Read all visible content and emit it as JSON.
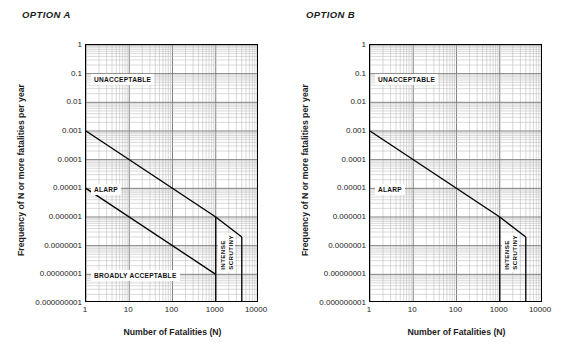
{
  "panels": [
    {
      "title": "OPTION A",
      "axes": {
        "ylabel": "Frequency of N or more fatalities per year",
        "xlabel": "Number of Fatalities (N)",
        "yticks": [
          "1",
          "0.1",
          "0.01",
          "0.001",
          "0.0001",
          "0.00001",
          "0.000001",
          "0.0000001",
          "0.00000001",
          "0.000000001"
        ],
        "xticks": [
          "1",
          "10",
          "100",
          "1000",
          "10000"
        ]
      },
      "zones": {
        "unacceptable": "UNACCEPTABLE",
        "alarp": "ALARP",
        "broadly_acceptable": "BROADLY ACCEPTABLE",
        "intense": "INTENSE",
        "scrutiny": "SCRUTINY"
      }
    },
    {
      "title": "OPTION B",
      "axes": {
        "ylabel": "Frequency of N or more fatalities per year",
        "xlabel": "Number of Fatalities (N)",
        "yticks": [
          "1",
          "0.1",
          "0.01",
          "0.001",
          "0.0001",
          "0.00001",
          "0.000001",
          "0.0000001",
          "0.00000001",
          "0.000000001"
        ],
        "xticks": [
          "1",
          "10",
          "100",
          "1000",
          "10000"
        ]
      },
      "zones": {
        "unacceptable": "UNACCEPTABLE",
        "alarp": "ALARP",
        "broadly_acceptable": "",
        "intense": "INTENSE",
        "scrutiny": "SCRUTINY"
      }
    }
  ],
  "colors": {
    "line": "#000000",
    "major_grid": "#7a7a7a",
    "minor_grid": "#b9b9b9",
    "axis": "#000000",
    "text": "#1b1b1b",
    "background": "#ffffff"
  },
  "chart_data": [
    {
      "type": "line",
      "title": "OPTION A",
      "xlabel": "Number of Fatalities (N)",
      "ylabel": "Frequency of N or more fatalities per year",
      "xscale": "log",
      "yscale": "log",
      "xlim": [
        1,
        10000
      ],
      "ylim": [
        1e-09,
        1
      ],
      "xticks": [
        1,
        10,
        100,
        1000,
        10000
      ],
      "yticks": [
        1,
        0.1,
        0.01,
        0.001,
        0.0001,
        1e-05,
        1e-06,
        1e-07,
        1e-08,
        1e-09
      ],
      "grid": "log-minor-both",
      "legend": "none",
      "series": [
        {
          "name": "Upper intolerability limit (UNACCEPTABLE / ALARP boundary)",
          "points": [
            [
              1,
              0.001
            ],
            [
              1000,
              1e-06
            ],
            [
              4000,
              2e-07
            ]
          ]
        },
        {
          "name": "Lower negligibility limit (ALARP / BROADLY ACCEPTABLE boundary)",
          "points": [
            [
              1,
              1e-05
            ],
            [
              1000,
              1e-08
            ]
          ]
        }
      ],
      "vertical_markers": [
        {
          "name": "intense-scrutiny-left",
          "x": 1000
        },
        {
          "name": "intense-scrutiny-right",
          "x": 4000
        }
      ],
      "annotations": [
        {
          "text": "UNACCEPTABLE",
          "x": 3,
          "y": 0.07
        },
        {
          "text": "ALARP",
          "x": 3,
          "y": 3e-05
        },
        {
          "text": "BROADLY ACCEPTABLE",
          "x": 3,
          "y": 1e-08
        },
        {
          "text": "INTENSE",
          "x": 1300,
          "y": 1e-07,
          "rotation": -90
        },
        {
          "text": "SCRUTINY",
          "x": 2400,
          "y": 1e-07,
          "rotation": -90
        }
      ]
    },
    {
      "type": "line",
      "title": "OPTION B",
      "xlabel": "Number of Fatalities (N)",
      "ylabel": "Frequency of N or more fatalities per year",
      "xscale": "log",
      "yscale": "log",
      "xlim": [
        1,
        10000
      ],
      "ylim": [
        1e-09,
        1
      ],
      "xticks": [
        1,
        10,
        100,
        1000,
        10000
      ],
      "yticks": [
        1,
        0.1,
        0.01,
        0.001,
        0.0001,
        1e-05,
        1e-06,
        1e-07,
        1e-08,
        1e-09
      ],
      "grid": "log-minor-both",
      "legend": "none",
      "series": [
        {
          "name": "Upper intolerability limit (UNACCEPTABLE / ALARP boundary)",
          "points": [
            [
              1,
              0.001
            ],
            [
              1000,
              1e-06
            ],
            [
              4000,
              2e-07
            ]
          ]
        }
      ],
      "vertical_markers": [
        {
          "name": "intense-scrutiny-left",
          "x": 1000
        },
        {
          "name": "intense-scrutiny-right",
          "x": 4000
        }
      ],
      "annotations": [
        {
          "text": "UNACCEPTABLE",
          "x": 3,
          "y": 0.07
        },
        {
          "text": "ALARP",
          "x": 3,
          "y": 3e-05
        },
        {
          "text": "INTENSE",
          "x": 1300,
          "y": 1e-07,
          "rotation": -90
        },
        {
          "text": "SCRUTINY",
          "x": 2400,
          "y": 1e-07,
          "rotation": -90
        }
      ]
    }
  ]
}
